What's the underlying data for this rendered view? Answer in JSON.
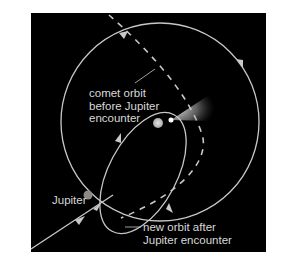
{
  "diagram": {
    "labels": {
      "comet_orbit_before": [
        "comet orbit",
        "before Jupiter",
        "encounter"
      ],
      "jupiter": "Jupiter",
      "new_orbit_after": [
        "new orbit after",
        "Jupiter encounter"
      ]
    },
    "elements": {
      "sun": "central body (Sun)",
      "jupiter_orbit": "large circular orbit with counter-clockwise arrows",
      "old_comet_path": "dashed path",
      "new_comet_orbit": "elongated ellipse"
    },
    "colors": {
      "background": "#000000",
      "line": "#c8c8c8",
      "jupiter": "#8a8a8a",
      "sun": "#d0d0d0",
      "text": "#d8d8d8"
    }
  }
}
